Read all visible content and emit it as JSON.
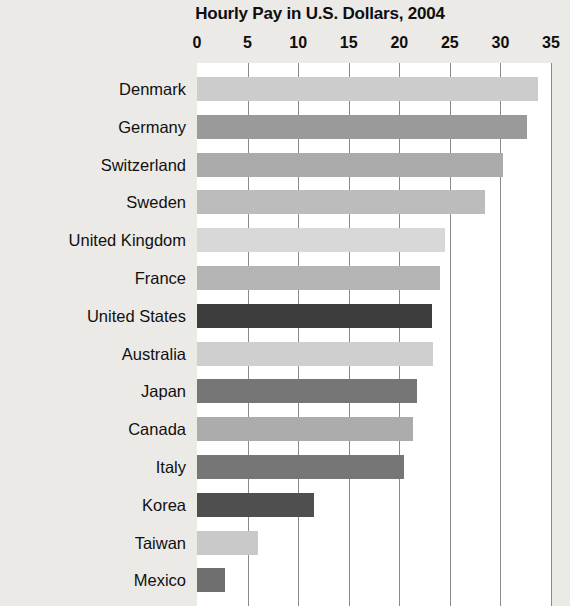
{
  "chart_data": {
    "type": "bar",
    "orientation": "horizontal",
    "title": "Hourly Pay in U.S. Dollars, 2004",
    "xlabel": "",
    "ylabel": "",
    "xlim": [
      0,
      35
    ],
    "xticks": [
      0,
      5,
      10,
      15,
      20,
      25,
      30,
      35
    ],
    "grid": true,
    "legend": "none",
    "background": "#ffffff",
    "page_background": "#eceae7",
    "categories": [
      "Denmark",
      "Germany",
      "Switzerland",
      "Sweden",
      "United Kingdom",
      "France",
      "United States",
      "Australia",
      "Japan",
      "Canada",
      "Italy",
      "Korea",
      "Taiwan",
      "Mexico"
    ],
    "values": [
      33.7,
      32.6,
      30.3,
      28.5,
      24.5,
      24.0,
      23.2,
      23.3,
      21.8,
      21.4,
      20.5,
      11.6,
      6.0,
      2.8
    ],
    "bar_colors": [
      "#cccccc",
      "#9a9a9a",
      "#ababab",
      "#bcbcbc",
      "#d8d8d8",
      "#b4b4b4",
      "#3d3d3d",
      "#cfcfcf",
      "#767676",
      "#acacac",
      "#767676",
      "#4f4f4f",
      "#c9c9c9",
      "#6e6e6e"
    ],
    "bars": [
      {
        "label": "Denmark",
        "value": 33.7,
        "color": "#cccccc"
      },
      {
        "label": "Germany",
        "value": 32.6,
        "color": "#9a9a9a"
      },
      {
        "label": "Switzerland",
        "value": 30.3,
        "color": "#ababab"
      },
      {
        "label": "Sweden",
        "value": 28.5,
        "color": "#bcbcbc"
      },
      {
        "label": "United Kingdom",
        "value": 24.5,
        "color": "#d8d8d8"
      },
      {
        "label": "France",
        "value": 24.0,
        "color": "#b4b4b4"
      },
      {
        "label": "United States",
        "value": 23.2,
        "color": "#3d3d3d"
      },
      {
        "label": "Australia",
        "value": 23.3,
        "color": "#cfcfcf"
      },
      {
        "label": "Japan",
        "value": 21.8,
        "color": "#767676"
      },
      {
        "label": "Canada",
        "value": 21.4,
        "color": "#acacac"
      },
      {
        "label": "Italy",
        "value": 20.5,
        "color": "#767676"
      },
      {
        "label": "Korea",
        "value": 11.6,
        "color": "#4f4f4f"
      },
      {
        "label": "Taiwan",
        "value": 6.0,
        "color": "#c9c9c9"
      },
      {
        "label": "Mexico",
        "value": 2.8,
        "color": "#6e6e6e"
      }
    ]
  }
}
